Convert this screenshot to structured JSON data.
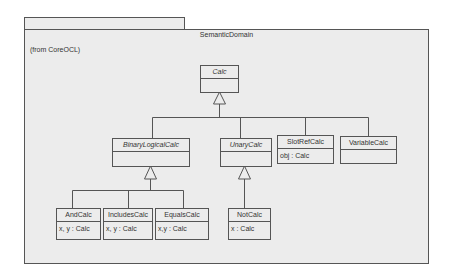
{
  "package": {
    "name": "SemanticDomain",
    "from": "(from CoreOCL)"
  },
  "classes": {
    "calc": {
      "name": "Calc",
      "abstract": true,
      "attrs": ""
    },
    "binary": {
      "name": "BinaryLogicalCalc",
      "abstract": true,
      "attrs": ""
    },
    "unary": {
      "name": "UnaryCalc",
      "abstract": true,
      "attrs": ""
    },
    "slotref": {
      "name": "SlotRefCalc",
      "abstract": false,
      "attrs": "obj : Calc"
    },
    "variable": {
      "name": "VariableCalc",
      "abstract": false,
      "attrs": ""
    },
    "and": {
      "name": "AndCalc",
      "abstract": false,
      "attrs": "x, y : Calc"
    },
    "includes": {
      "name": "IncludesCalc",
      "abstract": false,
      "attrs": "x, y : Calc"
    },
    "equals": {
      "name": "EqualsCalc",
      "abstract": false,
      "attrs": "x,y : Calc"
    },
    "not": {
      "name": "NotCalc",
      "abstract": false,
      "attrs": "x : Calc"
    }
  },
  "colors": {
    "line": "#555555",
    "fill": "#ececec",
    "text": "#333333"
  }
}
